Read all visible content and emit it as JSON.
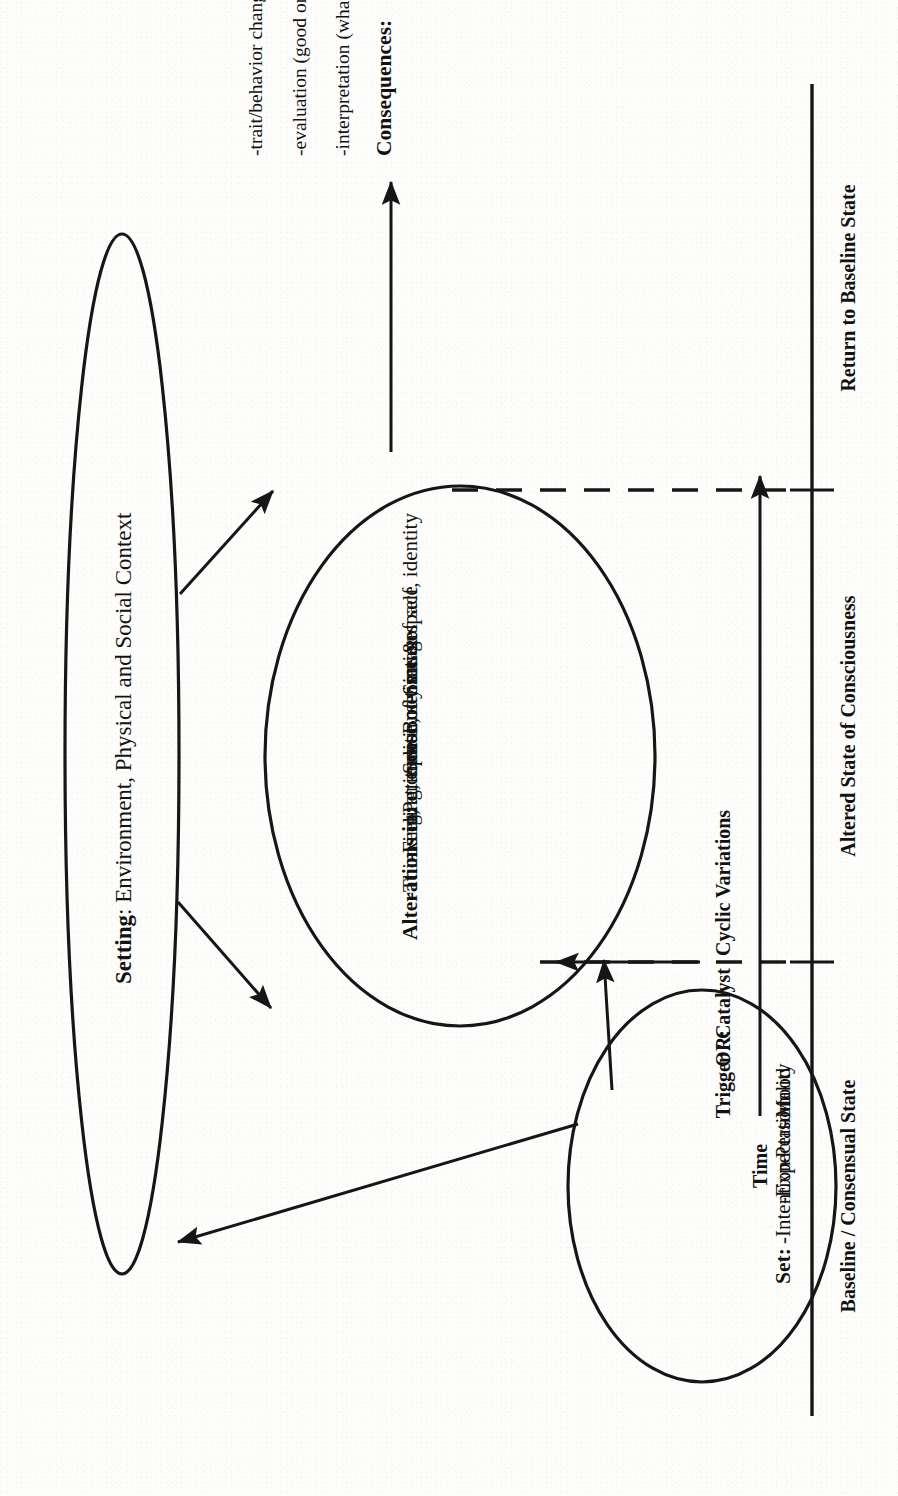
{
  "diagram": {
    "title_context": "Model of an altered state of consciousness over time",
    "setting": {
      "label_bold": "Setting",
      "label_rest": ": Environment, Physical and Social Context"
    },
    "set_ellipse": {
      "heading": "Set:",
      "items": [
        "-Intention",
        "-Expectation",
        "-Personality",
        "-Mood"
      ]
    },
    "asc_ellipse": {
      "heading": "Alterations in:",
      "items": [
        "-Thinking, attitude",
        "-Feeling, emotion",
        "-Perception, sensation",
        "-Sense of time & space",
        "-Body image",
        "-Sense of self, identity"
      ]
    },
    "consequences": {
      "heading": "Consequences:",
      "items": [
        "-interpretation (what?)",
        "-evaluation (good or bad?)",
        "-trait/behavior changes"
      ]
    },
    "trigger": {
      "line1": "Trigger / Catalyst",
      "line2_prefix": "OR:",
      "line2": "Cyclic Variations"
    },
    "axis": {
      "phases": [
        "Baseline / Consensual State",
        "Altered State of Consciousness",
        "Return to Baseline State"
      ],
      "time_label": "Time"
    },
    "colors": {
      "ink": "#161616",
      "paper": "#fdfdfc"
    }
  }
}
